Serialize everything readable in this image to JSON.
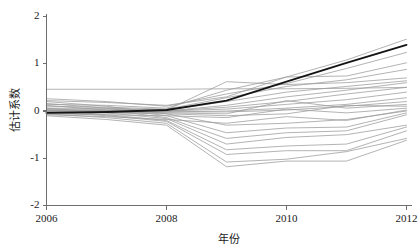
{
  "chart_data": {
    "type": "line",
    "title": "",
    "subtitle": "",
    "xlabel": "年份",
    "ylabel": "估计系数",
    "xlim": [
      2006,
      2012
    ],
    "ylim": [
      -2,
      2
    ],
    "grid": false,
    "legend": "none",
    "x": [
      2006,
      2007,
      2008,
      2009,
      2010,
      2011,
      2012
    ],
    "x_tick_labels": [
      "2006",
      "2008",
      "2010",
      "2012"
    ],
    "x_ticks": [
      2006,
      2008,
      2010,
      2012
    ],
    "y_ticks": [
      2,
      1,
      0,
      -1,
      -2
    ],
    "y_tick_labels": [
      "2",
      "1",
      "0",
      "-1",
      "-2"
    ],
    "series": [
      {
        "name": "处理组估计值",
        "role": "main",
        "color": "#141414",
        "values": [
          -0.04,
          -0.02,
          0.02,
          0.22,
          0.62,
          1.02,
          1.4
        ]
      },
      {
        "name": "安慰剂检验 1",
        "role": "placebo",
        "color": "#9a9a9a",
        "values": [
          0.46,
          0.46,
          0.46,
          0.47,
          0.47,
          0.48,
          0.5
        ]
      },
      {
        "name": "安慰剂检验 2",
        "role": "placebo",
        "color": "#9a9a9a",
        "values": [
          0.22,
          0.18,
          0.12,
          0.3,
          0.72,
          1.08,
          1.52
        ]
      },
      {
        "name": "安慰剂检验 3",
        "role": "placebo",
        "color": "#9a9a9a",
        "values": [
          0.26,
          0.2,
          0.1,
          0.36,
          0.58,
          0.9,
          1.24
        ]
      },
      {
        "name": "安慰剂检验 4",
        "role": "placebo",
        "color": "#9a9a9a",
        "values": [
          0.14,
          0.12,
          0.06,
          0.44,
          0.72,
          0.74,
          1.02
        ]
      },
      {
        "name": "安慰剂检验 5",
        "role": "placebo",
        "color": "#9a9a9a",
        "values": [
          0.1,
          0.08,
          0.04,
          0.28,
          0.52,
          0.66,
          0.88
        ]
      },
      {
        "name": "安慰剂检验 6",
        "role": "placebo",
        "color": "#9a9a9a",
        "values": [
          0.06,
          0.06,
          0.02,
          0.62,
          0.56,
          0.6,
          0.7
        ]
      },
      {
        "name": "安慰剂检验 7",
        "role": "placebo",
        "color": "#9a9a9a",
        "values": [
          0.04,
          0.04,
          0.02,
          0.2,
          0.4,
          0.52,
          0.64
        ]
      },
      {
        "name": "安慰剂检验 8",
        "role": "placebo",
        "color": "#9a9a9a",
        "values": [
          0.02,
          0.02,
          0.0,
          0.12,
          0.3,
          0.44,
          0.6
        ]
      },
      {
        "name": "安慰剂检验 9",
        "role": "placebo",
        "color": "#9a9a9a",
        "values": [
          0.02,
          0.01,
          0.0,
          0.08,
          0.2,
          0.36,
          0.5
        ]
      },
      {
        "name": "安慰剂检验 10",
        "role": "placebo",
        "color": "#9a9a9a",
        "values": [
          0.0,
          0.0,
          0.0,
          0.04,
          0.14,
          0.24,
          0.4
        ]
      },
      {
        "name": "安慰剂检验 11",
        "role": "placebo",
        "color": "#9a9a9a",
        "values": [
          0.0,
          -0.01,
          -0.02,
          0.0,
          0.06,
          0.14,
          0.28
        ]
      },
      {
        "name": "安慰剂检验 12",
        "role": "placebo",
        "color": "#9a9a9a",
        "values": [
          -0.02,
          -0.02,
          -0.02,
          -0.02,
          0.02,
          0.1,
          0.2
        ]
      },
      {
        "name": "安慰剂检验 13",
        "role": "placebo",
        "color": "#9a9a9a",
        "values": [
          -0.02,
          -0.03,
          -0.04,
          -0.06,
          0.22,
          0.06,
          0.14
        ]
      },
      {
        "name": "安慰剂检验 14",
        "role": "placebo",
        "color": "#9a9a9a",
        "values": [
          -0.04,
          -0.04,
          -0.06,
          -0.1,
          -0.06,
          0.12,
          0.1
        ]
      },
      {
        "name": "安慰剂检验 15",
        "role": "placebo",
        "color": "#9a9a9a",
        "values": [
          -0.06,
          -0.08,
          -0.1,
          -0.14,
          0.04,
          -0.04,
          0.06
        ]
      },
      {
        "name": "安慰剂检验 16",
        "role": "placebo",
        "color": "#9a9a9a",
        "values": [
          -0.08,
          -0.12,
          -0.18,
          -0.26,
          -0.12,
          -0.2,
          0.02
        ]
      },
      {
        "name": "安慰剂检验 17",
        "role": "placebo",
        "color": "#9a9a9a",
        "values": [
          0.2,
          0.1,
          -0.06,
          -0.3,
          -0.26,
          -0.18,
          0.0
        ]
      },
      {
        "name": "安慰剂检验 18",
        "role": "placebo",
        "color": "#9a9a9a",
        "values": [
          0.16,
          0.06,
          -0.1,
          -0.46,
          -0.36,
          -0.34,
          -0.04
        ]
      },
      {
        "name": "安慰剂检验 19",
        "role": "placebo",
        "color": "#9a9a9a",
        "values": [
          0.12,
          0.02,
          -0.14,
          -0.58,
          -0.46,
          -0.42,
          -0.08
        ]
      },
      {
        "name": "安慰剂检验 20",
        "role": "placebo",
        "color": "#9a9a9a",
        "values": [
          0.06,
          -0.04,
          -0.16,
          -0.7,
          -0.56,
          -0.5,
          -0.3
        ]
      },
      {
        "name": "安慰剂检验 21",
        "role": "placebo",
        "color": "#9a9a9a",
        "values": [
          0.02,
          -0.08,
          -0.2,
          -0.82,
          -0.74,
          -0.7,
          -0.34
        ]
      },
      {
        "name": "安慰剂检验 22",
        "role": "placebo",
        "color": "#9a9a9a",
        "values": [
          -0.02,
          -0.1,
          -0.22,
          -0.92,
          -0.84,
          -0.84,
          -0.42
        ]
      },
      {
        "name": "安慰剂检验 23",
        "role": "placebo",
        "color": "#9a9a9a",
        "values": [
          -0.06,
          -0.14,
          -0.26,
          -1.08,
          -1.02,
          -0.86,
          -0.58
        ]
      },
      {
        "name": "安慰剂检验 24",
        "role": "placebo",
        "color": "#9a9a9a",
        "values": [
          -0.1,
          -0.18,
          -0.3,
          -1.18,
          -1.06,
          -1.06,
          -0.62
        ]
      }
    ]
  },
  "axes": {
    "x_axis_name": "年份",
    "y_axis_name": "估计系数",
    "x_tick_labels": [
      "2006",
      "2008",
      "2010",
      "2012"
    ],
    "y_tick_labels": [
      "2",
      "1",
      "0",
      "-1",
      "-2"
    ]
  }
}
